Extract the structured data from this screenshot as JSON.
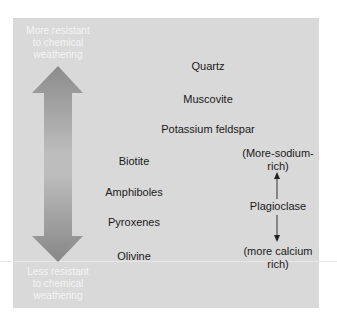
{
  "figure": {
    "top_label": "More resistant\nto chemical\nweathering",
    "top_label_lines": [
      "More resistant",
      "to chemical",
      "weathering"
    ],
    "bottom_label_lines": [
      "Less resistant",
      "to chemical",
      "weathering"
    ],
    "arrow": "double-headed vertical arrow",
    "minerals": [
      "Quartz",
      "Muscovite",
      "Potassium feldspar",
      "Biotite",
      "Amphiboles",
      "Pyroxenes",
      "Olivine"
    ],
    "plagioclase": {
      "name": "Plagioclase",
      "top_lines": [
        "(More-sodium-",
        "rich)"
      ],
      "bottom_lines": [
        "(more calcium",
        "rich)"
      ]
    },
    "colors": {
      "panel": "#d9d9d9",
      "arrow": "#8a8a8a",
      "label_text": "#f4f4f4",
      "text": "#1a1a1a"
    }
  }
}
